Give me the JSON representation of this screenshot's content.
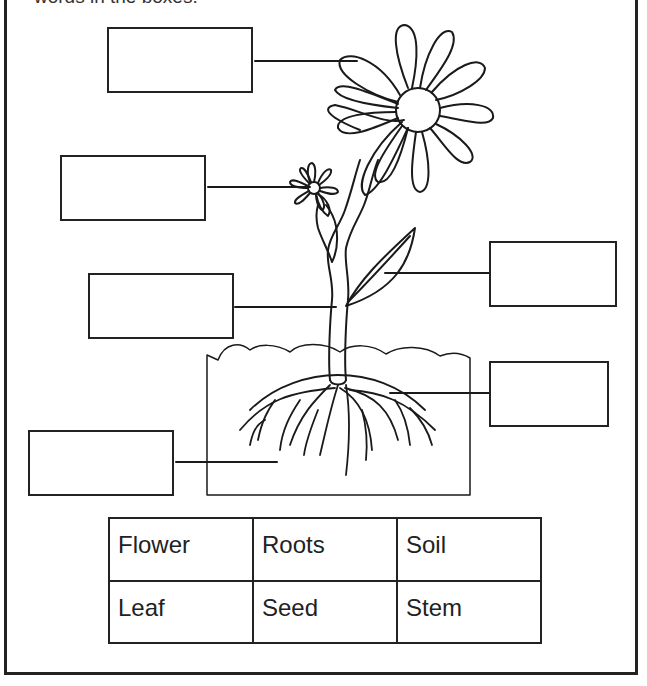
{
  "worksheet": {
    "instructions": "words in the boxes.",
    "border_color": "#222222"
  },
  "diagram": {
    "label_boxes": [
      {
        "id": "box-1",
        "points_to": "large-flower",
        "value": ""
      },
      {
        "id": "box-2",
        "points_to": "small-flower-seed-head",
        "value": ""
      },
      {
        "id": "box-3",
        "points_to": "stem",
        "value": ""
      },
      {
        "id": "box-4",
        "points_to": "leaf",
        "value": ""
      },
      {
        "id": "box-5",
        "points_to": "roots",
        "value": ""
      },
      {
        "id": "box-6",
        "points_to": "soil",
        "value": ""
      }
    ]
  },
  "word_bank": {
    "rows": [
      [
        "Flower",
        "Roots",
        "Soil"
      ],
      [
        "Leaf",
        "Seed",
        "Stem"
      ]
    ]
  }
}
